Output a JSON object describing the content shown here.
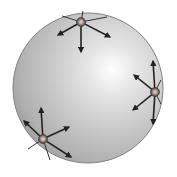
{
  "diagram": {
    "sphere": {
      "cx": 88,
      "cy": 88,
      "r": 75,
      "highlight": {
        "cx": 112,
        "cy": 70
      },
      "colors": {
        "highlight": "#ffffff",
        "mid": "#c8c8c8",
        "edge": "#9a9a9a",
        "outline": "#7a7a7a"
      }
    },
    "node_color": {
      "outer": "#6b6b6b",
      "inner": "#d8a890",
      "ring": "#444444"
    },
    "arrow_color": "#222222",
    "nodes": [
      {
        "id": "top",
        "x": 81,
        "y": 22,
        "arrows": [
          {
            "x2": 81,
            "y2": 52,
            "head": true
          },
          {
            "x2": 58,
            "y2": 35,
            "head": true
          },
          {
            "x2": 110,
            "y2": 37,
            "head": true
          },
          {
            "x2": 62,
            "y2": 16,
            "head": false
          },
          {
            "x2": 107,
            "y2": 17,
            "head": false
          },
          {
            "x2": 83,
            "y2": 11,
            "head": false
          }
        ]
      },
      {
        "id": "right",
        "x": 155,
        "y": 92,
        "arrows": [
          {
            "x2": 134,
            "y2": 75,
            "head": true
          },
          {
            "x2": 133,
            "y2": 110,
            "head": true
          },
          {
            "x2": 153,
            "y2": 61,
            "head": true
          },
          {
            "x2": 153,
            "y2": 124,
            "head": true
          },
          {
            "x2": 161,
            "y2": 80,
            "head": false
          },
          {
            "x2": 161,
            "y2": 104,
            "head": false
          }
        ]
      },
      {
        "id": "bottom-left",
        "x": 43,
        "y": 139,
        "arrows": [
          {
            "x2": 41,
            "y2": 108,
            "head": true
          },
          {
            "x2": 69,
            "y2": 127,
            "head": true
          },
          {
            "x2": 71,
            "y2": 157,
            "head": true
          },
          {
            "x2": 24,
            "y2": 121,
            "head": true
          },
          {
            "x2": 28,
            "y2": 149,
            "head": false
          },
          {
            "x2": 50,
            "y2": 160,
            "head": false
          }
        ]
      }
    ]
  }
}
